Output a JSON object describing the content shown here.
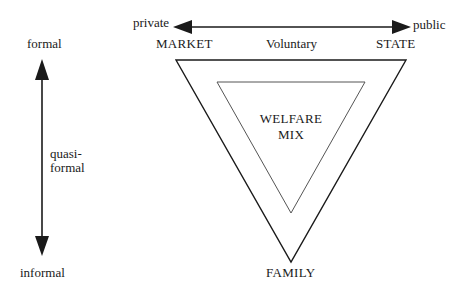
{
  "diagram": {
    "horizontal_axis": {
      "left_label": "private",
      "right_label": "public"
    },
    "vertical_axis": {
      "top_label": "formal",
      "middle_label_line1": "quasi-",
      "middle_label_line2": "formal",
      "bottom_label": "informal"
    },
    "triangle": {
      "top_left_vertex": "MARKET",
      "top_middle": "Voluntary",
      "top_right_vertex": "STATE",
      "bottom_vertex": "FAMILY"
    },
    "center": {
      "line1": "WELFARE",
      "line2": "MIX"
    },
    "colors": {
      "stroke": "#1a1a1a",
      "inner_stroke": "#555555",
      "background": "#ffffff"
    }
  }
}
